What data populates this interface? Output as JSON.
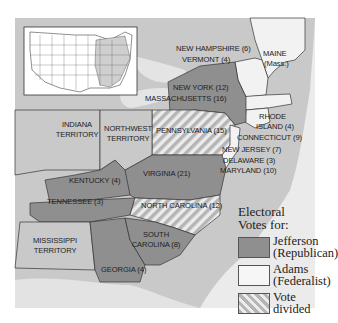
{
  "map": {
    "title": "Election of 1800 electoral map",
    "colors": {
      "jefferson": "#8f8f8f",
      "adams": "#f2f2f2",
      "divided_stripe_a": "#b8b8b8",
      "divided_stripe_b": "#ececec",
      "territory": "#c8c8c8",
      "water": "#e6e6e6",
      "inset_bg": "#ffffff"
    },
    "labels": {
      "new_hampshire": "NEW HAMPSHIRE (6)",
      "vermont": "VERMONT (4)",
      "maine_1": "MAINE",
      "maine_2": "(Mass.)",
      "new_york": "NEW YORK (12)",
      "massachusetts": "MASSACHUSETTS (16)",
      "rhode_island_1": "RHODE",
      "rhode_island_2": "ISLAND (4)",
      "connecticut": "CONNECTICUT (9)",
      "pennsylvania": "PENNSYLVANIA (15)",
      "new_jersey": "NEW JERSEY (7)",
      "delaware": "DELAWARE (3)",
      "maryland": "MARYLAND (10)",
      "indiana_1": "INDIANA",
      "indiana_2": "TERRITORY",
      "northwest_1": "NORTHWEST",
      "northwest_2": "TERRITORY",
      "kentucky": "KENTUCKY (4)",
      "virginia": "VIRGINIA (21)",
      "tennessee": "TENNESSEE (3)",
      "north_carolina": "NORTH CAROLINA (12)",
      "mississippi_1": "MISSISSIPPI",
      "mississippi_2": "TERRITORY",
      "south_carolina_1": "SOUTH",
      "south_carolina_2": "CAROLINA (8)",
      "georgia": "GEORGIA (4)"
    }
  },
  "legend": {
    "title_1": "Electoral",
    "title_2": "Votes for:",
    "items": [
      {
        "line1": "Jefferson",
        "line2": "(Republican)",
        "key": "jefferson"
      },
      {
        "line1": "Adams",
        "line2": "(Federalist)",
        "key": "adams"
      },
      {
        "line1": "Vote",
        "line2": "divided",
        "key": "divided"
      }
    ]
  }
}
